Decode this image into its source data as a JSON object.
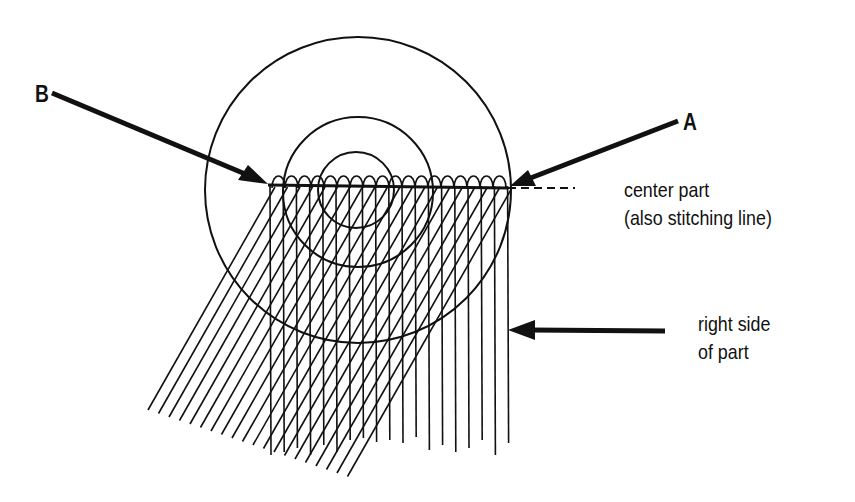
{
  "labels": {
    "a": "A",
    "b": "B",
    "center_part_line1": "center part",
    "center_part_line2": "(also stitching line)",
    "right_side_line1": "right side",
    "right_side_line2": "of part"
  },
  "geometry": {
    "circle_center": [
      358,
      185
    ],
    "circle_radii": [
      153,
      75,
      38
    ],
    "stitch_line": {
      "x1": 268,
      "x2": 508,
      "y": 185
    },
    "dashed_extension": {
      "x1": 508,
      "x2": 575,
      "y": 185
    }
  },
  "colors": {
    "ink": "#111111",
    "background": "#ffffff"
  }
}
